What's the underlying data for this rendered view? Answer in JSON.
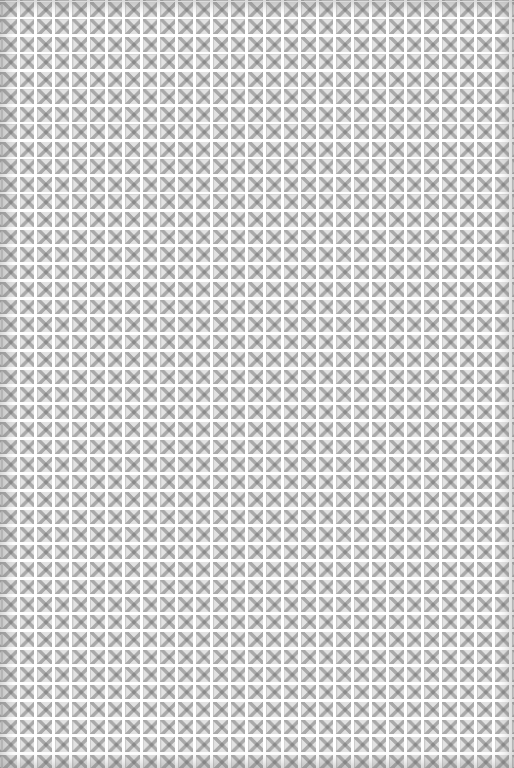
{
  "image": {
    "kind": "scanned decorative pattern texture",
    "description": "Repeating grid of small gray ornamental square tiles with a central cross motif and corner dots on white",
    "columns": 29,
    "rows": 44,
    "colors": {
      "background": "#fafafa",
      "tile": "#e2e2e2",
      "motif": "#8a8a8a",
      "grout": "#ffffff",
      "edge_shadow": "#787878"
    }
  }
}
